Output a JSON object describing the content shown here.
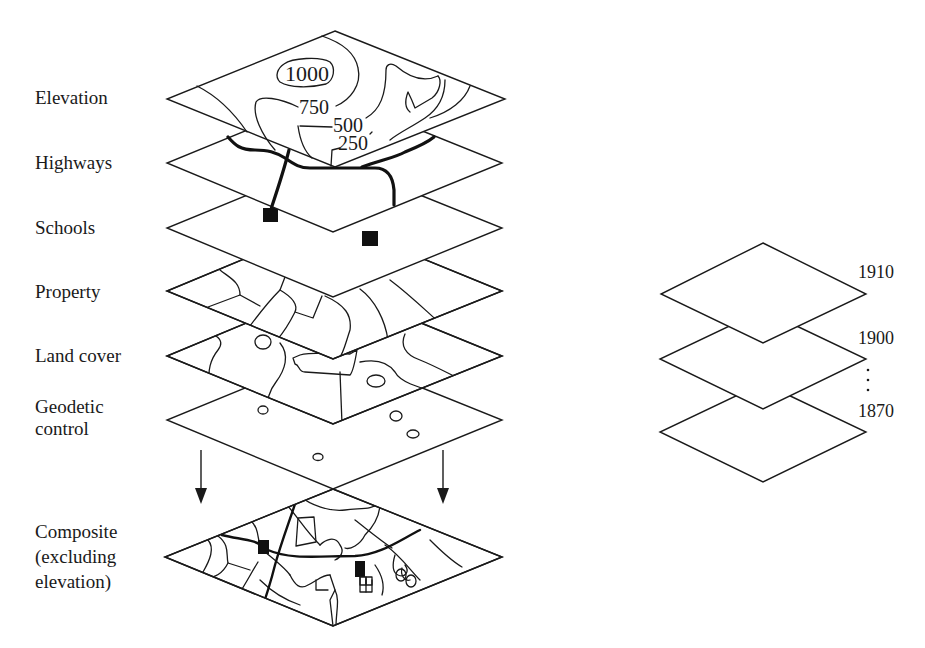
{
  "diagram": {
    "layers": [
      {
        "name": "Elevation",
        "contours": [
          "1000",
          "750",
          "500",
          "250"
        ]
      },
      {
        "name": "Highways"
      },
      {
        "name": "Schools"
      },
      {
        "name": "Property"
      },
      {
        "name": "Land cover"
      },
      {
        "name": "Geodetic\ncontrol"
      },
      {
        "name": "Composite\n(excluding\nelevation)"
      }
    ],
    "contour_labels": {
      "c1000": "1000",
      "c750": "750",
      "c500": "500",
      "c250": "250"
    },
    "time_series": {
      "labels": [
        "1910",
        "1900",
        "1870"
      ],
      "ellipsis": "⋮"
    },
    "colors": {
      "stroke": "#1a1a1a",
      "background": "#ffffff",
      "fill": "#111111"
    }
  }
}
